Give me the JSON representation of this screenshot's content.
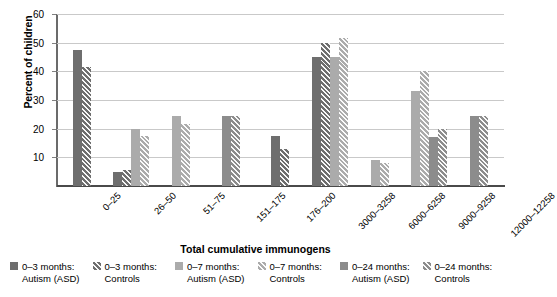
{
  "chart_data": {
    "type": "bar",
    "title": "",
    "xlabel": "Total cumulative immunogens",
    "ylabel": "Percent of children",
    "ylim": [
      0,
      60
    ],
    "yticks": [
      10,
      20,
      30,
      40,
      50,
      60
    ],
    "grid": true,
    "legend_position": "bottom",
    "categories": [
      "0–25",
      "26–50",
      "51–75",
      "151–175",
      "176–200",
      "3000–3258",
      "6000–6258",
      "9000–9258",
      "12000–12258"
    ],
    "series": [
      {
        "name": "0–3 months: Autism (ASD)",
        "color": "#6e6e6e",
        "pattern": "solid",
        "values": [
          47.5,
          5.0,
          null,
          null,
          17.5,
          45.0,
          null,
          null,
          null
        ]
      },
      {
        "name": "0–3 months: Controls",
        "color": "#6e6e6e",
        "pattern": "hatched",
        "values": [
          41.5,
          5.5,
          null,
          null,
          13.0,
          50.0,
          null,
          null,
          null
        ]
      },
      {
        "name": "0–7 months: Autism (ASD)",
        "color": "#ababab",
        "pattern": "solid",
        "values": [
          null,
          20.0,
          24.5,
          null,
          null,
          45.0,
          9.0,
          33.0,
          null
        ]
      },
      {
        "name": "0–7 months: Controls",
        "color": "#ababab",
        "pattern": "hatched",
        "values": [
          null,
          17.5,
          21.5,
          null,
          null,
          51.5,
          8.0,
          40.0,
          null
        ]
      },
      {
        "name": "0–24 months: Autism (ASD)",
        "color": "#8c8c8c",
        "pattern": "solid",
        "values": [
          null,
          null,
          null,
          24.5,
          null,
          null,
          null,
          17.0,
          24.5
        ]
      },
      {
        "name": "0–24 months: Controls",
        "color": "#8c8c8c",
        "pattern": "hatched",
        "values": [
          null,
          null,
          null,
          24.5,
          null,
          null,
          null,
          20.0,
          24.5
        ]
      }
    ]
  }
}
